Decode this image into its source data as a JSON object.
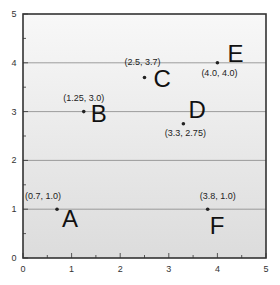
{
  "chart_data": {
    "type": "scatter",
    "title": "",
    "xlabel": "",
    "ylabel": "",
    "xlim": [
      0,
      5
    ],
    "ylim": [
      0,
      5
    ],
    "x_ticks": [
      "0",
      "1",
      "2",
      "3",
      "4",
      "5"
    ],
    "y_ticks": [
      "0",
      "1",
      "2",
      "3",
      "4",
      "5"
    ],
    "grid": "horizontal lines at y = 1, 2, 3, 4",
    "points": [
      {
        "label": "A",
        "x": 0.7,
        "y": 1.0,
        "annotation": "(0.7, 1.0)"
      },
      {
        "label": "B",
        "x": 1.25,
        "y": 3.0,
        "annotation": "(1.25, 3.0)"
      },
      {
        "label": "C",
        "x": 2.5,
        "y": 3.7,
        "annotation": "(2.5, 3.7)"
      },
      {
        "label": "D",
        "x": 3.3,
        "y": 2.75,
        "annotation": "(3.3, 2.75)"
      },
      {
        "label": "E",
        "x": 4.0,
        "y": 4.0,
        "annotation": "(4.0, 4.0)"
      },
      {
        "label": "F",
        "x": 3.8,
        "y": 1.0,
        "annotation": "(3.8, 1.0)"
      }
    ],
    "colors": {
      "background_top": "#f7f7f7",
      "background_bottom": "#dedede",
      "frame": "#333333",
      "gridline": "#888888",
      "point": "#222222"
    }
  }
}
